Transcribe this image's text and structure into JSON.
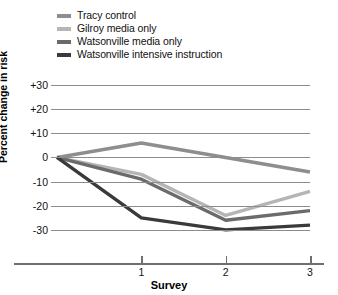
{
  "chart_data": {
    "type": "line",
    "title": "",
    "xlabel": "Survey",
    "ylabel": "Percent change in risk",
    "x": [
      0,
      1,
      2,
      3
    ],
    "xtick_labels": [
      "1",
      "2",
      "3"
    ],
    "xtick_values": [
      1,
      2,
      3
    ],
    "ytick_labels": [
      "+30",
      "+20",
      "+10",
      "0",
      "-10",
      "-20",
      "-30"
    ],
    "ytick_values": [
      30,
      20,
      10,
      0,
      -10,
      -20,
      -30
    ],
    "ylim": [
      -35,
      30
    ],
    "xlim": [
      0,
      3
    ],
    "grid": "horizontal",
    "legend_position": "above-plot-left",
    "series": [
      {
        "name": "Tracy control",
        "color": "#8e8e8e",
        "values": [
          0,
          6,
          0,
          -6
        ]
      },
      {
        "name": "Gilroy media only",
        "color": "#b5b5b5",
        "values": [
          0,
          -7,
          -24,
          -14
        ]
      },
      {
        "name": "Watsonville media only",
        "color": "#6b6b6b",
        "values": [
          0,
          -9,
          -26,
          -22
        ]
      },
      {
        "name": "Watsonville intensive instruction",
        "color": "#3a3a3a",
        "values": [
          0,
          -25,
          -30,
          -28
        ]
      }
    ]
  }
}
